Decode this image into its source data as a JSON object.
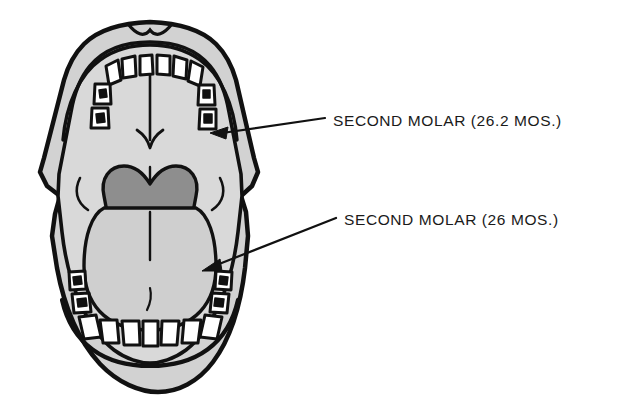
{
  "figure": {
    "background_color": "#ffffff"
  },
  "colors": {
    "outline": "#111111",
    "lip_gray": "#d2d2d2",
    "palate_gray": "#d9d9d9",
    "throat_dark_gray": "#8e8e8e",
    "tongue_gray": "#cfcfcf",
    "tooth_white": "#ffffff",
    "label_text": "#1a1a1a"
  },
  "callouts": [
    {
      "id": "upper-second-molar",
      "text": "SECOND MOLAR (26.2 MOS.)",
      "arch": "upper",
      "arrow_target_x": 213,
      "arrow_target_y": 133,
      "leader_start_x": 325,
      "leader_start_y": 118
    },
    {
      "id": "lower-second-molar",
      "text": "SECOND MOLAR (26 MOS.)",
      "arch": "lower",
      "arrow_target_x": 204,
      "arrow_target_y": 268,
      "leader_start_x": 336,
      "leader_start_y": 218
    }
  ],
  "anatomy": {
    "upper_arch_label": "Upper dental arch (maxillary)",
    "lower_arch_label": "Lower dental arch (mandibular)",
    "palate_label": "Hard palate",
    "palatal_arrow_label": "Palatal midline arrow",
    "throat_label": "Oropharynx / soft palate",
    "tongue_label": "Tongue",
    "lips_label": "Lips",
    "upper_tooth_count": 10,
    "lower_tooth_count": 10
  }
}
